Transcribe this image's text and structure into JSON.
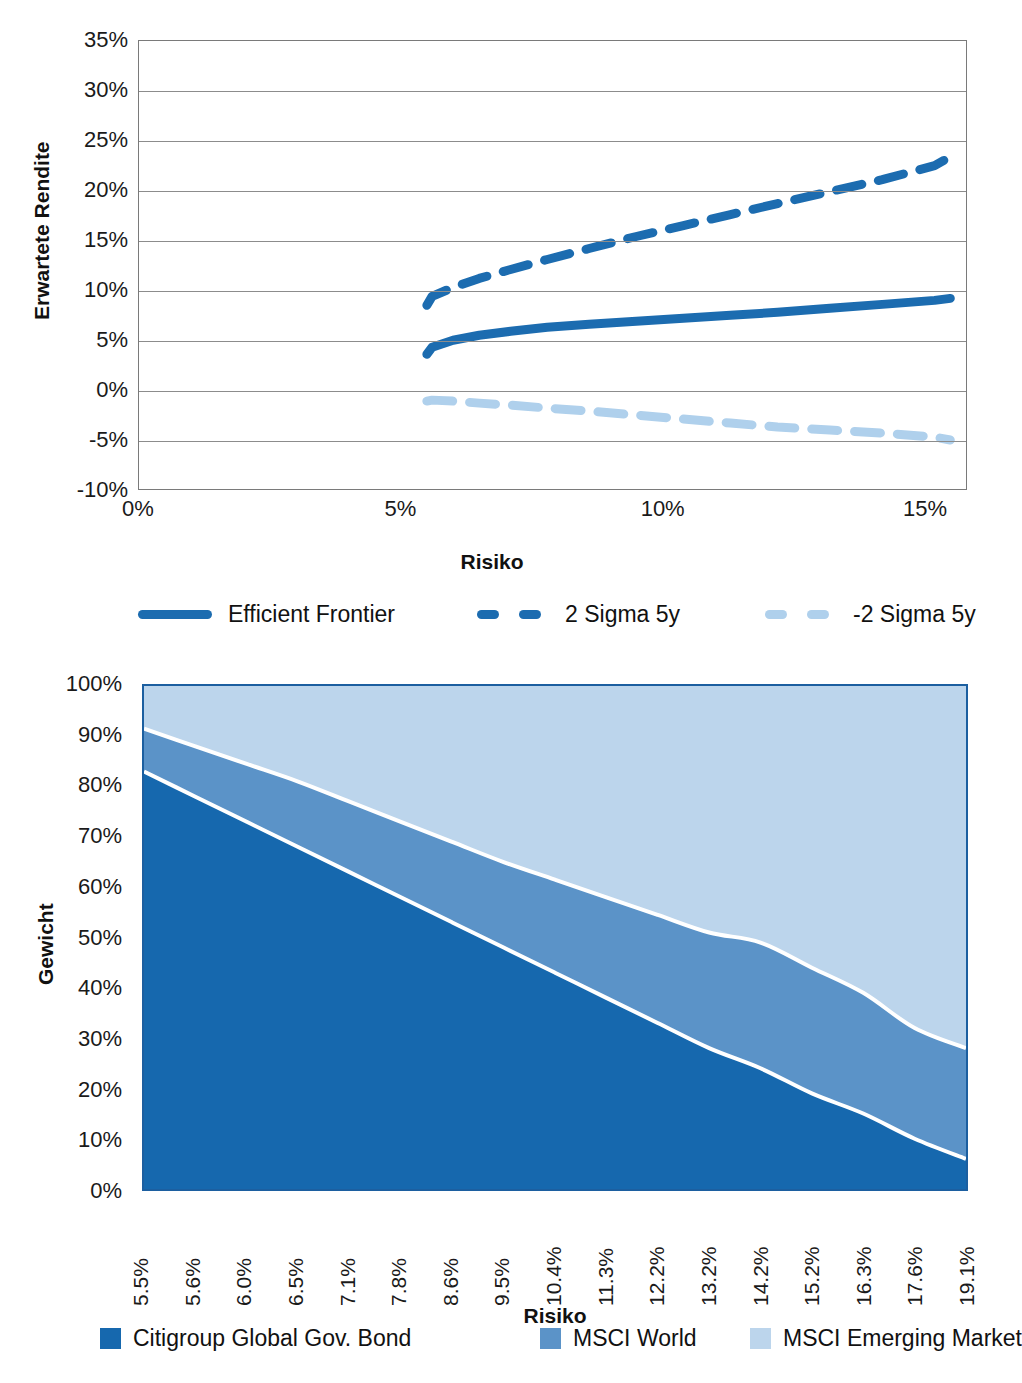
{
  "chart_data": [
    {
      "id": "efficient-frontier",
      "type": "line",
      "title": "",
      "xlabel": "Risiko",
      "ylabel": "Erwartete Rendite",
      "xlim": [
        0,
        15.8
      ],
      "ylim": [
        -10,
        35
      ],
      "xticks": [
        "0%",
        "5%",
        "10%",
        "15%"
      ],
      "xtick_values": [
        0,
        5,
        10,
        15
      ],
      "yticks": [
        "-10%",
        "-5%",
        "0%",
        "5%",
        "10%",
        "15%",
        "20%",
        "25%",
        "30%",
        "35%"
      ],
      "ytick_values": [
        -10,
        -5,
        0,
        5,
        10,
        15,
        20,
        25,
        30,
        35
      ],
      "grid": true,
      "legend_position": "bottom",
      "x": [
        5.5,
        5.6,
        6.0,
        6.5,
        7.1,
        7.8,
        8.6,
        9.5,
        10.4,
        11.3,
        12.2,
        13.2,
        14.2,
        15.2,
        15.5
      ],
      "series": [
        {
          "name": "Efficient Frontier",
          "style": "solid",
          "color": "#1c6CB0",
          "values": [
            3.6,
            4.3,
            5.0,
            5.5,
            5.9,
            6.3,
            6.6,
            6.9,
            7.2,
            7.5,
            7.8,
            8.2,
            8.6,
            9.0,
            9.2
          ]
        },
        {
          "name": "2 Sigma 5y",
          "style": "dashed",
          "color": "#1c6CB0",
          "values": [
            8.5,
            9.4,
            10.3,
            11.2,
            12.1,
            13.1,
            14.2,
            15.4,
            16.5,
            17.6,
            18.7,
            19.9,
            21.1,
            22.5,
            23.4
          ]
        },
        {
          "name": "-2 Sigma 5y",
          "style": "dashed",
          "color": "#AFD0EC",
          "values": [
            -1.1,
            -1.0,
            -1.1,
            -1.3,
            -1.5,
            -1.8,
            -2.1,
            -2.5,
            -2.9,
            -3.3,
            -3.7,
            -4.0,
            -4.3,
            -4.7,
            -5.0
          ]
        }
      ]
    },
    {
      "id": "asset-weights",
      "type": "area",
      "title": "",
      "xlabel": "Risiko",
      "ylabel": "Gewicht",
      "stacked": true,
      "ylim": [
        0,
        100
      ],
      "yticks": [
        "0%",
        "10%",
        "20%",
        "30%",
        "40%",
        "50%",
        "60%",
        "70%",
        "80%",
        "90%",
        "100%"
      ],
      "ytick_values": [
        0,
        10,
        20,
        30,
        40,
        50,
        60,
        70,
        80,
        90,
        100
      ],
      "categories": [
        "5.5%",
        "5.6%",
        "6.0%",
        "6.5%",
        "7.1%",
        "7.8%",
        "8.6%",
        "9.5%",
        "10.4%",
        "11.3%",
        "12.2%",
        "13.2%",
        "14.2%",
        "15.2%",
        "16.3%",
        "17.6%",
        "19.1%"
      ],
      "grid": false,
      "legend_position": "bottom",
      "series": [
        {
          "name": "Citigroup Global Gov. Bond",
          "color": "#1668AE",
          "values": [
            83,
            78,
            73,
            68,
            63,
            58,
            53,
            48,
            43,
            38,
            33,
            28,
            24,
            19,
            15,
            10,
            6
          ]
        },
        {
          "name": "MSCI World",
          "color": "#5B93C8",
          "values": [
            8.5,
            10.0,
            11.5,
            13.0,
            14.0,
            15.0,
            16.0,
            17.0,
            18.5,
            20.0,
            21.5,
            23.0,
            25.0,
            25.0,
            24.0,
            22.0,
            22.0
          ]
        },
        {
          "name": "MSCI Emerging Market",
          "color": "#BCD5EC",
          "values": [
            8.5,
            12.0,
            15.5,
            19.0,
            23.0,
            27.0,
            31.0,
            35.0,
            38.5,
            42.0,
            45.5,
            49.0,
            51.0,
            56.0,
            61.0,
            68.0,
            72.0
          ]
        }
      ]
    }
  ],
  "chart1": {
    "ylabel": "Erwartete Rendite",
    "xlabel": "Risiko",
    "yticks": [
      "35%",
      "30%",
      "25%",
      "20%",
      "15%",
      "10%",
      "5%",
      "0%",
      "-5%",
      "-10%"
    ],
    "xticks": [
      "0%",
      "5%",
      "10%",
      "15%"
    ],
    "legend": [
      {
        "label": "Efficient Frontier",
        "marker": "solid-line",
        "color": "#1c6CB0"
      },
      {
        "label": "2 Sigma 5y",
        "marker": "dashed-line",
        "color": "#1c6CB0"
      },
      {
        "label": "-2 Sigma 5y",
        "marker": "dashed-line",
        "color": "#AFD0EC"
      }
    ]
  },
  "chart2": {
    "ylabel": "Gewicht",
    "xlabel": "Risiko",
    "yticks": [
      "100%",
      "90%",
      "80%",
      "70%",
      "60%",
      "50%",
      "40%",
      "30%",
      "20%",
      "10%",
      "0%"
    ],
    "xticks": [
      "5.5%",
      "5.6%",
      "6.0%",
      "6.5%",
      "7.1%",
      "7.8%",
      "8.6%",
      "9.5%",
      "10.4%",
      "11.3%",
      "12.2%",
      "13.2%",
      "14.2%",
      "15.2%",
      "16.3%",
      "17.6%",
      "19.1%"
    ],
    "legend": [
      {
        "label": "Citigroup Global Gov. Bond",
        "color": "#1668AE"
      },
      {
        "label": "MSCI World",
        "color": "#5B93C8"
      },
      {
        "label": "MSCI Emerging Market",
        "color": "#BCD5EC"
      }
    ]
  },
  "colors": {
    "dark_blue": "#1668AE",
    "mid_blue": "#5B93C8",
    "light_blue": "#BCD5EC",
    "line_blue": "#1c6CB0",
    "pale_line_blue": "#AFD0EC",
    "gridline": "#8c8c8c",
    "plot_border": "#7a7a7a"
  }
}
